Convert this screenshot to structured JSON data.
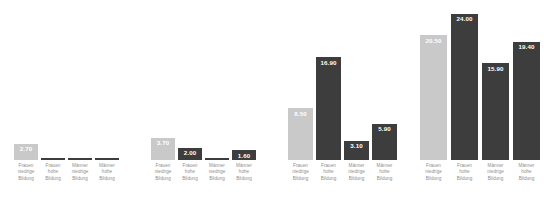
{
  "chart_data": {
    "type": "bar",
    "title": "",
    "subtitle": "",
    "xlabel": "",
    "ylabel": "",
    "grid": false,
    "legend": "none",
    "ylim": [
      0,
      26
    ],
    "categories": [
      "Frauen niedrige Bildung",
      "Frauen hohe Bildung",
      "Männer niedrige Bildung",
      "Männer hohe Bildung"
    ],
    "category_lines": [
      [
        "Frauen",
        "niedrige",
        "Bildung"
      ],
      [
        "Frauen",
        "hohe",
        "Bildung"
      ],
      [
        "Männer",
        "niedrige",
        "Bildung"
      ],
      [
        "Männer",
        "hohe",
        "Bildung"
      ]
    ],
    "series": [
      {
        "name": "Gruppe 1",
        "values": [
          2.7,
          0.3,
          0.35,
          0.3
        ],
        "labels": [
          "2.70",
          "",
          "",
          ""
        ]
      },
      {
        "name": "Gruppe 2",
        "values": [
          3.7,
          2.0,
          0.4,
          1.6
        ],
        "labels": [
          "3.70",
          "2.00",
          "",
          "1.60"
        ]
      },
      {
        "name": "Gruppe 3",
        "values": [
          8.5,
          16.9,
          3.1,
          5.9
        ],
        "labels": [
          "8.50",
          "16.90",
          "3.10",
          "5.90"
        ]
      },
      {
        "name": "Gruppe 4",
        "values": [
          20.5,
          24.0,
          15.9,
          19.4
        ],
        "labels": [
          "20.50",
          "24.00",
          "15.90",
          "19.40"
        ]
      }
    ],
    "colors": {
      "light_bar": "#c9c9c9",
      "dark_bar": "#3d3d3d",
      "value_label_text": "#ffffff",
      "category_label_text": "#8e8e8e",
      "background": "#ffffff"
    }
  }
}
